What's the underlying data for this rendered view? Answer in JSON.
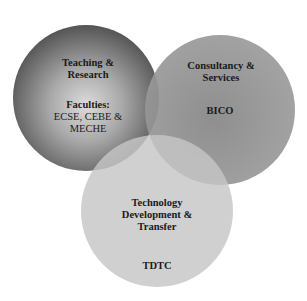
{
  "diagram": {
    "type": "venn",
    "circles": [
      {
        "id": "teaching",
        "title_lines": [
          "Teaching &",
          "Research"
        ],
        "sub_lines": [
          "Faculties:",
          "ECSE, CEBE &",
          "MECHE"
        ],
        "color_center": "#d8d8d8",
        "color_edge": "#555555"
      },
      {
        "id": "consultancy",
        "title_lines": [
          "Consultancy &",
          "Services"
        ],
        "sub_lines": [
          "BICO"
        ],
        "color_center": "#8a8a8a",
        "color_edge": "#9a9a9a"
      },
      {
        "id": "technology",
        "title_lines": [
          "Technology",
          "Development &",
          "Transfer"
        ],
        "sub_lines": [
          "TDTC"
        ],
        "color_center": "#c4c4c4",
        "color_edge": "#c4c4c4"
      }
    ]
  }
}
